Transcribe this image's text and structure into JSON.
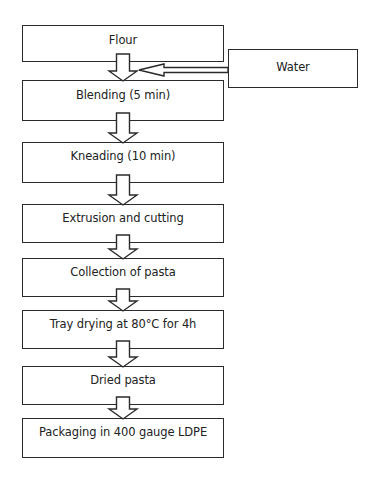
{
  "diagram": {
    "type": "process-flowchart",
    "steps": [
      {
        "label": "Flour",
        "x": 22,
        "y": 25,
        "w": 202,
        "h": 37,
        "pad": 7
      },
      {
        "label": "Blending (5 min)",
        "x": 22,
        "y": 80,
        "w": 202,
        "h": 41,
        "pad": 7
      },
      {
        "label": "Kneading (10 min)",
        "x": 22,
        "y": 142,
        "w": 202,
        "h": 41,
        "pad": 6
      },
      {
        "label": "Extrusion and cutting",
        "x": 22,
        "y": 204,
        "w": 202,
        "h": 39,
        "pad": 6
      },
      {
        "label": "Collection of pasta",
        "x": 22,
        "y": 258,
        "w": 202,
        "h": 39,
        "pad": 6
      },
      {
        "label": "Tray drying at 80°C for 4h",
        "x": 22,
        "y": 310,
        "w": 202,
        "h": 39,
        "pad": 6
      },
      {
        "label": "Dried pasta",
        "x": 22,
        "y": 366,
        "w": 202,
        "h": 39,
        "pad": 6
      },
      {
        "label": "Packaging in 400 gauge LDPE",
        "x": 22,
        "y": 418,
        "w": 202,
        "h": 40,
        "pad": 6
      }
    ],
    "side_input": {
      "label": "Water",
      "x": 228,
      "y": 49,
      "w": 130,
      "h": 39,
      "pad": 10,
      "feeds_into": "Blending (5 min)"
    },
    "edges": [
      [
        "Flour",
        "Blending (5 min)"
      ],
      [
        "Water",
        "Blending (5 min)"
      ],
      [
        "Blending (5 min)",
        "Kneading (10 min)"
      ],
      [
        "Kneading (10 min)",
        "Extrusion and cutting"
      ],
      [
        "Extrusion and cutting",
        "Collection of pasta"
      ],
      [
        "Collection of pasta",
        "Tray drying at 80°C for 4h"
      ],
      [
        "Tray drying at 80°C for 4h",
        "Dried pasta"
      ],
      [
        "Dried pasta",
        "Packaging in 400 gauge LDPE"
      ]
    ],
    "colors": {
      "stroke": "#2b2b2b",
      "fill": "#ffffff",
      "text": "#222222"
    }
  }
}
